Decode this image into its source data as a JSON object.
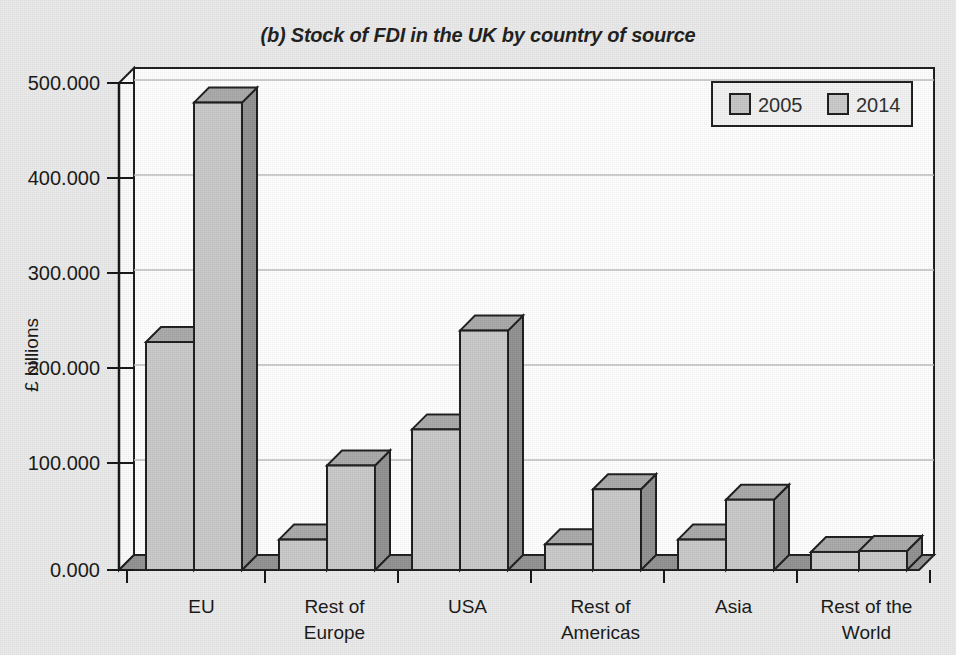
{
  "chart_data": {
    "type": "bar",
    "title": "(b) Stock of FDI in the UK by country of source",
    "xlabel": "",
    "ylabel": "£ billions",
    "categories": [
      "EU",
      "Rest of\nEurope",
      "USA",
      "Rest of\nAmericas",
      "Asia",
      "Rest of the\nWorld"
    ],
    "series": [
      {
        "name": "2005",
        "values": [
          240,
          32,
          148,
          27,
          32,
          19
        ]
      },
      {
        "name": "2014",
        "values": [
          492,
          110,
          252,
          85,
          74,
          20
        ]
      }
    ],
    "ylim": [
      0,
      500
    ],
    "yticks": [
      0,
      100,
      200,
      300,
      400,
      500
    ],
    "ytick_labels": [
      "0.000",
      "100.000",
      "200.000",
      "300.000",
      "400.000",
      "500.000"
    ],
    "grid": true,
    "legend_position": "top-right",
    "style": "3d-columns"
  },
  "legend": {
    "entries": [
      {
        "label": "2005",
        "swatch_color": "#c4c4c4"
      },
      {
        "label": "2014",
        "swatch_color": "#c9c9c9"
      }
    ]
  },
  "colors": {
    "page_background": "#e9e9e9",
    "plot_background": "#ffffff",
    "bar_front": "#c8c8c8",
    "bar_side": "#8f8f8f",
    "bar_top": "#a8a8a8",
    "bar_outline": "#1a1a1a",
    "floor": "#909090",
    "gridline": "#b8b8b8",
    "axis": "#111111",
    "text": "#141414"
  }
}
